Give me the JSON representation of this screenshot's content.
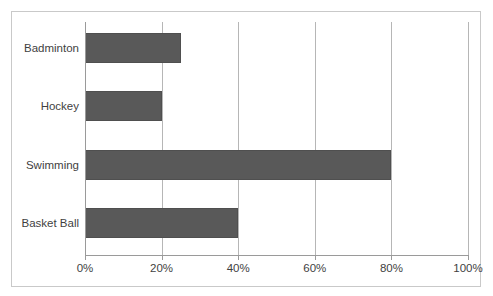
{
  "chart_data": {
    "type": "bar",
    "orientation": "horizontal",
    "title": "",
    "xlabel": "",
    "ylabel": "",
    "categories": [
      "Badminton",
      "Hockey",
      "Swimming",
      "Basket Ball"
    ],
    "values": [
      25,
      20,
      80,
      40
    ],
    "value_suffix": "%",
    "xlim": [
      0,
      100
    ],
    "xticks": [
      0,
      20,
      40,
      60,
      80,
      100
    ],
    "xtick_labels": [
      "0%",
      "20%",
      "40%",
      "60%",
      "80%",
      "100%"
    ],
    "grid": "vertical",
    "legend": "none",
    "series": [
      {
        "name": "Series 1",
        "values": [
          25,
          20,
          80,
          40
        ],
        "color": "#595959"
      }
    ],
    "colors": {
      "bar": "#595959",
      "bar_border": "#4f4f4f",
      "gridline": "#b6b6b6",
      "axis": "#9a9a9a",
      "frame": "#c9c9c9",
      "text": "#3f3f3f",
      "background": "#ffffff"
    }
  }
}
